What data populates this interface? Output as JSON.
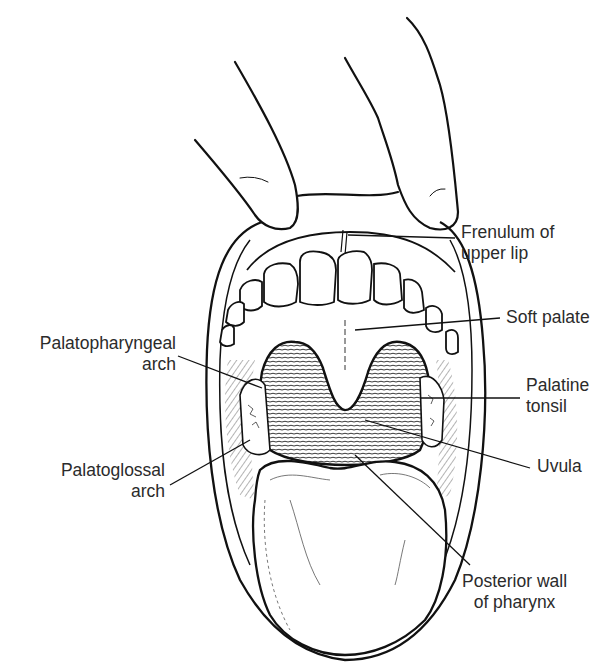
{
  "figure": {
    "style": "black-and-white line drawing",
    "ink_color": "#111111",
    "background_color": "#ffffff"
  },
  "labels": {
    "frenulum_upper_lip": {
      "line1": "Frenulum of",
      "line2": "upper lip"
    },
    "soft_palate": {
      "line1": "Soft palate"
    },
    "palatopharyngeal_arch": {
      "line1": "Palatopharyngeal",
      "line2": "arch"
    },
    "palatine_tonsil": {
      "line1": "Palatine",
      "line2": "tonsil"
    },
    "palatoglossal_arch": {
      "line1": "Palatoglossal",
      "line2": "arch"
    },
    "uvula": {
      "line1": "Uvula"
    },
    "posterior_wall_pharynx": {
      "line1": "Posterior wall",
      "line2": "of pharynx"
    }
  }
}
